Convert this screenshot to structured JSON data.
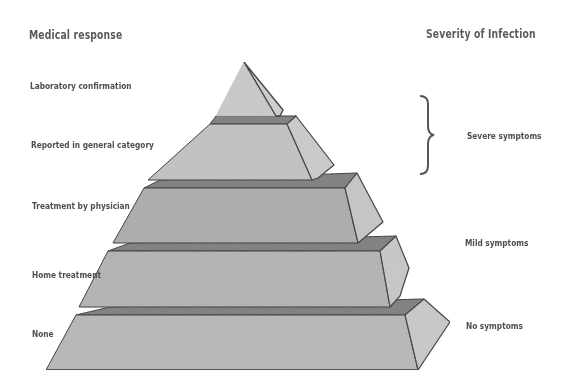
{
  "diagram": {
    "left_heading": "Medical response",
    "right_heading": "Severity of Infection",
    "tiers": [
      {
        "level": 1,
        "medical_response": "Laboratory confirmation"
      },
      {
        "level": 2,
        "medical_response": "Reported in general category"
      },
      {
        "level": 3,
        "medical_response": "Treatment by physician"
      },
      {
        "level": 4,
        "medical_response": "Home treatment"
      },
      {
        "level": 5,
        "medical_response": "None"
      }
    ],
    "severity_labels": [
      {
        "label": "Severe symptoms",
        "spans_tiers": [
          1,
          2
        ],
        "bracket": "right-curly-brace"
      },
      {
        "label": "Mild symptoms",
        "spans_tiers": [
          3,
          4
        ]
      },
      {
        "label": "No symptoms",
        "spans_tiers": [
          5
        ]
      }
    ],
    "colors": {
      "front_face": "#b4b4b4",
      "top_tier_face": "#c6c6c6",
      "side_face": "#c8c8c8",
      "ledge": "#7c7c7c",
      "edge": "#2e2e2e",
      "text": "#555555"
    }
  }
}
